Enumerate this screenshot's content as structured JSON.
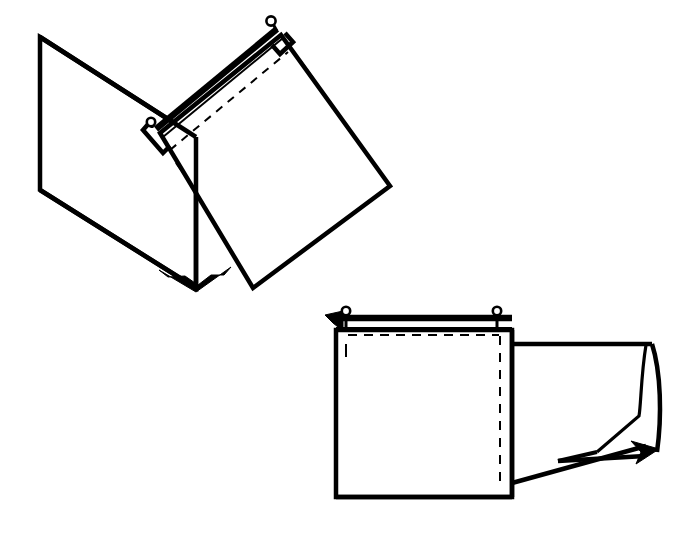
{
  "figure": {
    "canvas": {
      "width": 679,
      "height": 539
    },
    "background_color": "#ffffff",
    "line_color": "#000000",
    "style": "technical patent line drawing, black ink on white, no text labels"
  },
  "views": [
    {
      "name": "upper-view",
      "description": "Open folder with left panel and hinged rotated right panel joined at a bottom vertex, carrying a top rod with end pins",
      "parts": [
        {
          "name": "left-panel",
          "shape": "quadrilateral",
          "points": "40,37 196,137 196,288 40,190",
          "stroke_width": 4
        },
        {
          "name": "left-panel-inner-fold",
          "shape": "polyline",
          "points": "196,137 196,288",
          "stroke_width": 4
        },
        {
          "name": "rotated-right-panel",
          "shape": "quadrilateral",
          "points": "160,133 281,35 390,186 253,288",
          "stroke_width": 4
        },
        {
          "name": "rod-bar",
          "shape": "thick-double-line",
          "points": "156,128 277,28",
          "stroke_width": 6
        },
        {
          "name": "rod-highlight-line",
          "shape": "line",
          "points": "162,136 282,37",
          "stroke_width": 2
        },
        {
          "name": "seam-dashed-line",
          "shape": "dashed-line",
          "points": "168,148 287,50",
          "dash": "8 7"
        },
        {
          "name": "left-hook-bracket",
          "shape": "polyline",
          "points": "151,124 145,131 164,152 171,145",
          "stroke_width": 4
        },
        {
          "name": "right-hook-bracket",
          "shape": "polyline",
          "points": "284,33 291,41 279,52 272,44",
          "stroke_width": 4
        },
        {
          "name": "left-pin",
          "shape": "circle-on-stem",
          "center": "150,123",
          "radius": 4
        },
        {
          "name": "right-pin",
          "shape": "circle-on-stem",
          "center": "272,22",
          "radius": 4.5
        },
        {
          "name": "short-dash-right",
          "shape": "dash",
          "points": "299,59 312,77"
        },
        {
          "name": "short-dash-left",
          "shape": "dash",
          "points": "175,162 188,180"
        },
        {
          "name": "bottom-vertex-wedge",
          "shape": "filled-triangle",
          "points": "160,271 196,291 230,268 224,275 197,284 167,277",
          "fill": "#000000"
        }
      ]
    },
    {
      "name": "lower-view",
      "description": "Front view of folder front panel with top rod, two hanging pins, dashed seam, and a folded-back right side flap",
      "parts": [
        {
          "name": "front-panel",
          "shape": "rectangle",
          "points": "336,330 512,330 512,497 336,497",
          "stroke_width": 4
        },
        {
          "name": "rod-bar",
          "shape": "thick-double-line",
          "points": "334,318 512,318",
          "stroke_width": 6
        },
        {
          "name": "rod-lower-edge",
          "shape": "line",
          "points": "334,328 512,328",
          "stroke_width": 2
        },
        {
          "name": "left-arrow-marker",
          "shape": "filled-arrow",
          "points": "326,316 342,313 342,330",
          "fill": "#000000"
        },
        {
          "name": "left-pin",
          "shape": "circle-on-stem",
          "center": "346,323",
          "radius": 4
        },
        {
          "name": "right-pin",
          "shape": "circle-on-stem",
          "center": "497,323",
          "radius": 4
        },
        {
          "name": "top-dashed-seam",
          "shape": "dashed-line",
          "points": "346,334 500,334",
          "dash": "9 7"
        },
        {
          "name": "vertical-dashed-seam",
          "shape": "dashed-line",
          "points": "500,334 500,483",
          "dash": "9 8"
        },
        {
          "name": "short-vertical-dash-left",
          "shape": "dash",
          "points": "346,343 346,356"
        },
        {
          "name": "back-flap-top-edge",
          "shape": "line",
          "points": "512,344 655,344",
          "stroke_width": 4
        },
        {
          "name": "back-flap-right-curve",
          "shape": "curve",
          "points": "655,344 661,400 657,452",
          "stroke_width": 4
        },
        {
          "name": "flap-fold-diagonal",
          "shape": "line",
          "points": "512,483 645,446",
          "stroke_width": 4
        },
        {
          "name": "flap-inner-fold",
          "shape": "polyline",
          "points": "645,345 640,414 598,452",
          "stroke_width": 3
        },
        {
          "name": "flap-bottom-edge",
          "shape": "line",
          "points": "558,461 650,455",
          "stroke_width": 4
        },
        {
          "name": "flap-corner-arrow",
          "shape": "filled-arrow",
          "points": "634,444 658,450 637,463",
          "fill": "#000000"
        }
      ]
    }
  ]
}
